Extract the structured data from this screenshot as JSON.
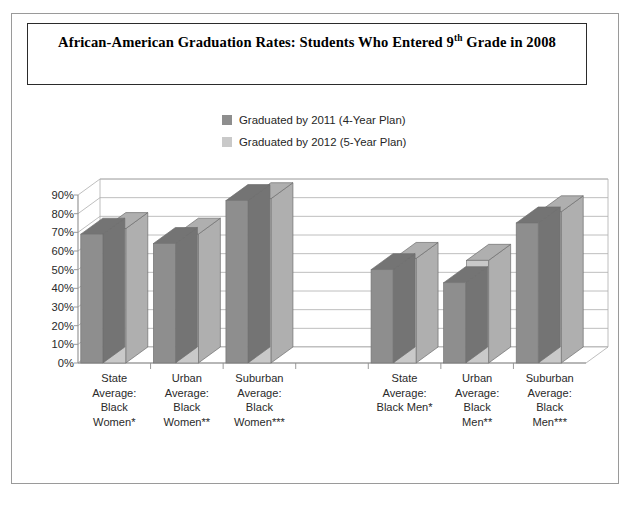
{
  "chart_data": {
    "type": "bar",
    "title": "African-American Graduation Rates: Students Who Entered 9th Grade in 2008",
    "title_parts": {
      "before_sup": "African-American Graduation Rates: Students Who Entered 9",
      "sup": "th",
      "after_sup": " Grade in 2008"
    },
    "xlabel": "",
    "ylabel": "",
    "ylim": [
      0,
      90
    ],
    "ytick_labels": [
      "0%",
      "10%",
      "20%",
      "30%",
      "40%",
      "50%",
      "60%",
      "70%",
      "80%",
      "90%"
    ],
    "ytick_values": [
      0,
      10,
      20,
      30,
      40,
      50,
      60,
      70,
      80,
      90
    ],
    "grid": true,
    "legend_position": "top-center",
    "style": "3d-clustered-column",
    "categories": [
      "State Average: Black Women*",
      "Urban Average: Black Women**",
      "Suburban Average: Black Women***",
      "",
      "State Average: Black Men*",
      "Urban Average: Black Men**",
      "Suburban Average: Black Men***"
    ],
    "category_lines": [
      [
        "State",
        "Average:",
        "Black",
        "Women*"
      ],
      [
        "Urban",
        "Average:",
        "Black",
        "Women**"
      ],
      [
        "Suburban",
        "Average:",
        "Black",
        "Women***"
      ],
      [
        ""
      ],
      [
        "State",
        "Average:",
        "Black Men*"
      ],
      [
        "Urban",
        "Average:",
        "Black",
        "Men**"
      ],
      [
        "Suburban",
        "Average:",
        "Black",
        "Men***"
      ]
    ],
    "series": [
      {
        "name": "Graduated by 2011 (4-Year Plan)",
        "color": "#8e8e8e",
        "values": [
          69,
          64,
          87,
          null,
          50,
          43,
          75
        ]
      },
      {
        "name": "Graduated by 2012 (5-Year Plan)",
        "color": "#c9c9c9",
        "values": [
          72,
          69,
          88,
          null,
          56,
          55,
          81
        ]
      }
    ]
  },
  "legend": {
    "items": [
      {
        "label": "Graduated by 2011 (4-Year Plan)",
        "color": "#8e8e8e"
      },
      {
        "label": "Graduated by 2012 (5-Year Plan)",
        "color": "#c9c9c9"
      }
    ]
  },
  "colors": {
    "series_dark": "#8e8e8e",
    "series_light": "#c9c9c9",
    "gridline": "#adadad",
    "axis": "#8f8f8f",
    "frame": "#9a9a9a",
    "title_border": "#2b2b2b",
    "text": "#262626"
  }
}
